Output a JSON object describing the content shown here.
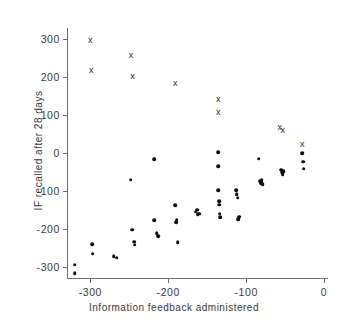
{
  "chart_data": {
    "type": "scatter",
    "title": "",
    "xlabel": "Information feedback administered",
    "ylabel": "IF recalled after 28 days",
    "xlim": [
      -330,
      5
    ],
    "ylim": [
      -330,
      330
    ],
    "xticks": [
      -300,
      -200,
      -100,
      0
    ],
    "xticklabels": [
      "-300",
      "-200",
      "-100",
      "0"
    ],
    "yticks": [
      300,
      200,
      100,
      0,
      -100,
      -200,
      -300
    ],
    "yticklabels": [
      "300",
      "200",
      "100",
      "0",
      "-100",
      "-200",
      "-300"
    ],
    "grid": false,
    "legend": null,
    "marker_color": "#111111",
    "axis_color": "#6e6e6e",
    "series": [
      {
        "name": "dot",
        "marker": "filled-circle",
        "points": [
          [
            -320,
            -295
          ],
          [
            -320,
            -318
          ],
          [
            -298,
            -240
          ],
          [
            -297,
            -266
          ],
          [
            -270,
            -272
          ],
          [
            -266,
            -276
          ],
          [
            -248,
            -70
          ],
          [
            -246,
            -202
          ],
          [
            -244,
            -234
          ],
          [
            -243,
            -242
          ],
          [
            -218,
            -17
          ],
          [
            -218,
            -178
          ],
          [
            -215,
            -212
          ],
          [
            -213,
            -219
          ],
          [
            -191,
            -138
          ],
          [
            -190,
            -182
          ],
          [
            -189,
            -176
          ],
          [
            -188,
            -236
          ],
          [
            -165,
            -155
          ],
          [
            -163,
            -150
          ],
          [
            -162,
            -162
          ],
          [
            -160,
            -160
          ],
          [
            -136,
            2
          ],
          [
            -136,
            -35
          ],
          [
            -136,
            -98
          ],
          [
            -135,
            -128
          ],
          [
            -135,
            -137
          ],
          [
            -134,
            -160
          ],
          [
            -133,
            -170
          ],
          [
            -113,
            -98
          ],
          [
            -112,
            -108
          ],
          [
            -111,
            -118
          ],
          [
            -110,
            -175
          ],
          [
            -109,
            -168
          ],
          [
            -84,
            -15
          ],
          [
            -82,
            -75
          ],
          [
            -81,
            -80
          ],
          [
            -80,
            -72
          ],
          [
            -79,
            -82
          ],
          [
            -55,
            -44
          ],
          [
            -54,
            -50
          ],
          [
            -53,
            -56
          ],
          [
            -52,
            -48
          ],
          [
            -28,
            0
          ],
          [
            -27,
            -23
          ],
          [
            -26,
            -41
          ]
        ]
      },
      {
        "name": "cross",
        "marker": "x",
        "points": [
          [
            -300,
            299
          ],
          [
            -299,
            219
          ],
          [
            -248,
            258
          ],
          [
            -246,
            204
          ],
          [
            -191,
            184
          ],
          [
            -136,
            142
          ],
          [
            -136,
            107
          ],
          [
            -57,
            68
          ],
          [
            -53,
            62
          ],
          [
            -28,
            25
          ]
        ]
      }
    ]
  }
}
